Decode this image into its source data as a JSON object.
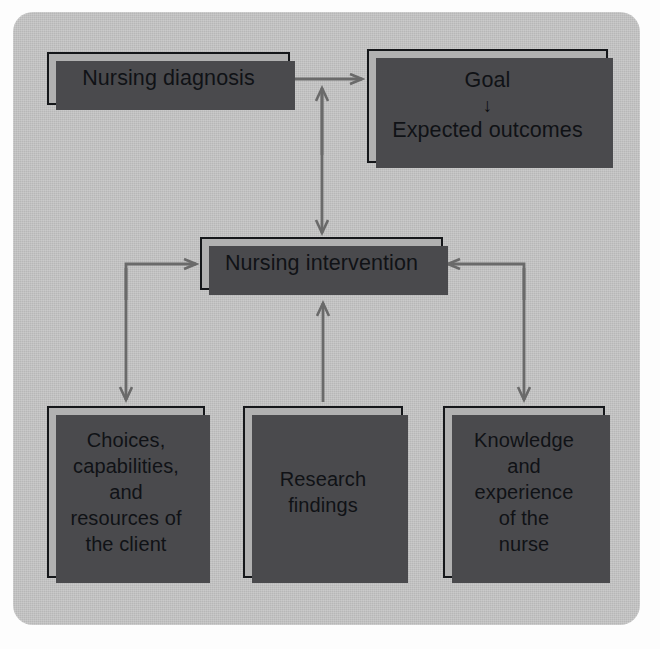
{
  "diagram": {
    "palette": {
      "panel_bg": "#c5c5c5",
      "node_fill": "#b1b1b1",
      "node_border": "#15171a",
      "node_shadow": "#4a4a4d",
      "connector": "#6a6a6a",
      "text": "#101216"
    },
    "nodes": [
      {
        "id": "diagnosis",
        "label": "Nursing diagnosis"
      },
      {
        "id": "goal",
        "label_top": "Goal",
        "inner_arrow": "down-arrow-icon",
        "label_bottom": "Expected outcomes"
      },
      {
        "id": "intervention",
        "label": "Nursing intervention"
      },
      {
        "id": "choices",
        "label": "Choices,\ncapabilities,\nand\nresources of\nthe client"
      },
      {
        "id": "research",
        "label": "Research\nfindings"
      },
      {
        "id": "knowledge",
        "label": "Knowledge\nand\nexperience\nof the\nnurse"
      }
    ],
    "connectors": [
      {
        "id": "diagnosis-to-goal",
        "from": "diagnosis",
        "to": "goal",
        "arrows": "single"
      },
      {
        "id": "diagnosis-goal-to-intervention",
        "from": "diagnosis/goal",
        "to": "intervention",
        "arrows": "double"
      },
      {
        "id": "intervention-to-choices",
        "from": "intervention",
        "to": "choices",
        "arrows": "double"
      },
      {
        "id": "research-to-intervention",
        "from": "research",
        "to": "intervention",
        "arrows": "single"
      },
      {
        "id": "intervention-to-knowledge",
        "from": "intervention",
        "to": "knowledge",
        "arrows": "double"
      }
    ]
  }
}
